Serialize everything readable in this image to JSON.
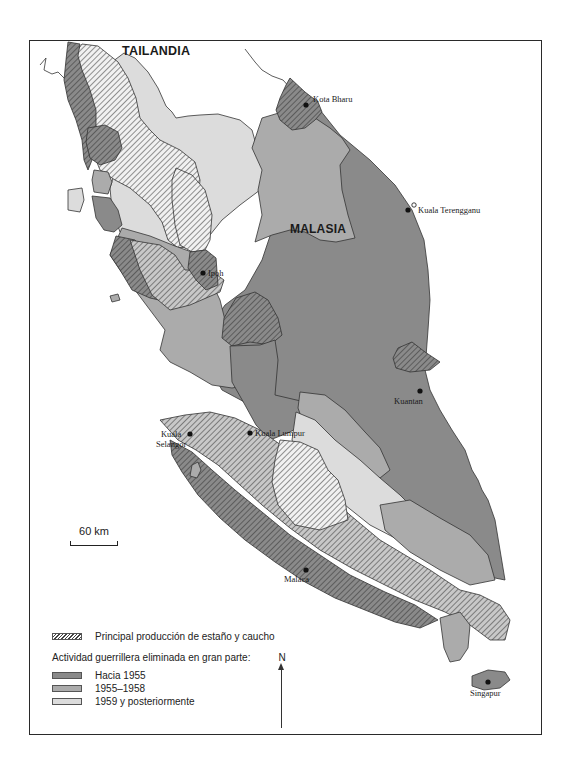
{
  "map": {
    "country_labels": {
      "north": "TAILANDIA",
      "main": "MALASIA"
    },
    "cities": [
      {
        "name": "Kota Bharu",
        "marker": "filled"
      },
      {
        "name": "Kuala Terengganu",
        "marker": "filled-and-open"
      },
      {
        "name": "Ipoh",
        "marker": "filled"
      },
      {
        "name": "Kuantan",
        "marker": "filled"
      },
      {
        "name": "Kuala Lumpur",
        "marker": "filled"
      },
      {
        "name": "Kuala Selangor",
        "line1": "Kuala",
        "line2": "Selangor",
        "marker": "filled"
      },
      {
        "name": "Malaca",
        "marker": "filled"
      },
      {
        "name": "Singapur",
        "marker": "filled"
      }
    ],
    "scale_bar": {
      "label": "60 km"
    },
    "north_arrow": {
      "label": "N"
    },
    "colors": {
      "hacia_1955": "#8a8a8a",
      "1955_1958": "#ababab",
      "1959_posteriormente": "#dcdcdc",
      "hatch_line": "#333333",
      "border": "#2a2a2a"
    }
  },
  "legend": {
    "hatch_label": "Principal producción de estaño y caucho",
    "heading": "Actividad guerrillera eliminada en gran parte:",
    "items": [
      {
        "label": "Hacia 1955",
        "color": "#8a8a8a"
      },
      {
        "label": "1955–1958",
        "color": "#ababab"
      },
      {
        "label": "1959 y posteriormente",
        "color": "#dcdcdc"
      }
    ]
  }
}
